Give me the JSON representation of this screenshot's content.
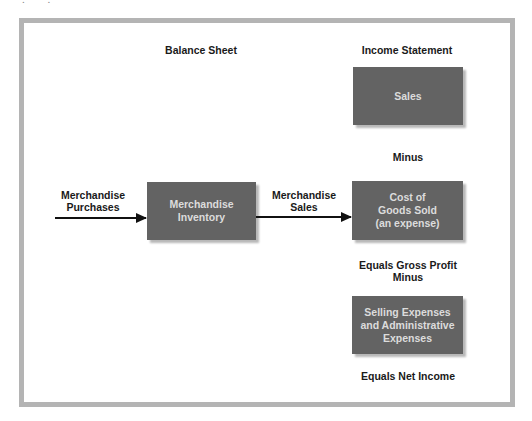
{
  "top_fragment": "'.  '.",
  "headers": {
    "balance_sheet": "Balance Sheet",
    "income_statement": "Income Statement"
  },
  "flow_labels": {
    "purchases": [
      "Merchandise",
      "Purchases"
    ],
    "sales": [
      "Merchandise",
      "Sales"
    ]
  },
  "boxes": {
    "inventory": [
      "Merchandise",
      "Inventory"
    ],
    "sales": [
      "Sales"
    ],
    "cogs": [
      "Cost of",
      "Goods Sold",
      "(an expense)"
    ],
    "selling_admin": [
      "Selling Expenses",
      "and Administrative",
      "Expenses"
    ]
  },
  "operators": {
    "minus_1": "Minus",
    "gross_profit": "Equals Gross Profit",
    "minus_2": "Minus",
    "net_income": "Equals Net Income"
  },
  "colors": {
    "frame": "#b4b4b4",
    "box_fill": "#636363",
    "box_text": "#dcdcdc",
    "label_text": "#1a1a1a",
    "arrow": "#111111"
  }
}
